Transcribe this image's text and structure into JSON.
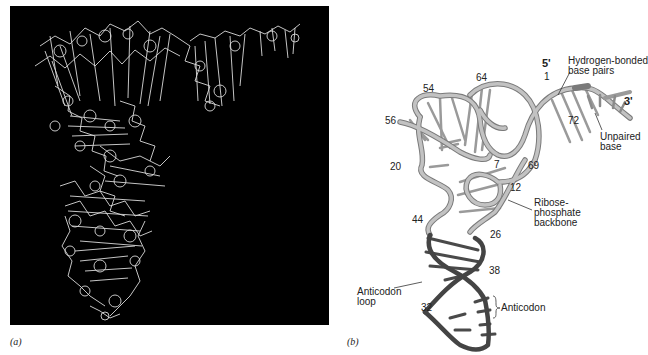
{
  "figure": {
    "panel_a": {
      "caption": "(a)",
      "description": "Stick model of tRNA molecule on black background",
      "background": "#000000",
      "stroke": "#e8e8e8"
    },
    "panel_b": {
      "caption": "(b)",
      "colors": {
        "backbone_light": "#b8b8b8",
        "backbone_outline": "#7a7a7a",
        "backbone_dark": "#4a4a4a"
      },
      "end_labels": {
        "five_prime": "5'",
        "three_prime": "3'"
      },
      "numbers": {
        "n1": "1",
        "n54": "54",
        "n64": "64",
        "n56": "56",
        "n72": "72",
        "n20": "20",
        "n7": "7",
        "n69": "69",
        "n12": "12",
        "n44": "44",
        "n26": "26",
        "n38": "38",
        "n32": "32"
      },
      "annotations": {
        "hbond": "Hydrogen-bonded\nbase pairs",
        "unpaired": "Unpaired\nbase",
        "ribose": "Ribose-\nphosphate\nbackbone",
        "loop": "Anticodon\nloop",
        "anticodon": "Anticodon"
      }
    }
  }
}
